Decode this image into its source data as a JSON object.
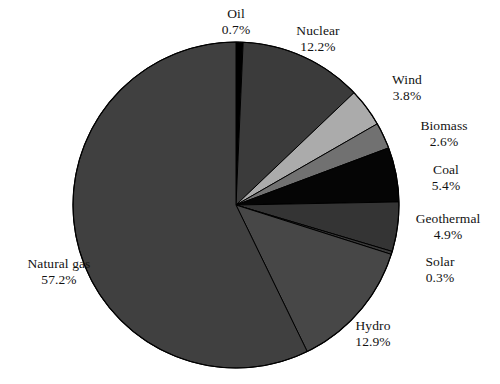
{
  "chart_data": {
    "type": "pie",
    "title": "",
    "subtitle": "",
    "xlabel": "",
    "ylabel": "",
    "legend_position": "labels-outside",
    "grid": false,
    "units": "percent",
    "start_angle_deg": 0,
    "direction": "clockwise",
    "categories": [
      "Oil",
      "Nuclear",
      "Wind",
      "Biomass",
      "Coal",
      "Geothermal",
      "Solar",
      "Hydro",
      "Natural gas"
    ],
    "values": [
      0.7,
      12.2,
      3.8,
      2.6,
      5.4,
      4.9,
      0.3,
      12.9,
      57.2
    ],
    "labels": [
      "0.7%",
      "12.2%",
      "3.8%",
      "2.6%",
      "5.4%",
      "4.9%",
      "0.3%",
      "12.9%",
      "57.2%"
    ],
    "slices": [
      {
        "name": "Oil",
        "value": 0.7,
        "label": "0.7%",
        "color": "#000000"
      },
      {
        "name": "Nuclear",
        "value": 12.2,
        "label": "12.2%",
        "color": "#3b3b3b"
      },
      {
        "name": "Wind",
        "value": 3.8,
        "label": "3.8%",
        "color": "#ababab"
      },
      {
        "name": "Biomass",
        "value": 2.6,
        "label": "2.6%",
        "color": "#717171"
      },
      {
        "name": "Coal",
        "value": 5.4,
        "label": "5.4%",
        "color": "#050505"
      },
      {
        "name": "Geothermal",
        "value": 4.9,
        "label": "4.9%",
        "color": "#343434"
      },
      {
        "name": "Solar",
        "value": 0.3,
        "label": "0.3%",
        "color": "#3a3a3a"
      },
      {
        "name": "Hydro",
        "value": 12.9,
        "label": "12.9%",
        "color": "#474747"
      },
      {
        "name": "Natural gas",
        "value": 57.2,
        "label": "57.2%",
        "color": "#404040"
      }
    ]
  },
  "labels": {
    "oil": {
      "name": "Oil",
      "pct": "0.7%"
    },
    "nuclear": {
      "name": "Nuclear",
      "pct": "12.2%"
    },
    "wind": {
      "name": "Wind",
      "pct": "3.8%"
    },
    "biomass": {
      "name": "Biomass",
      "pct": "2.6%"
    },
    "coal": {
      "name": "Coal",
      "pct": "5.4%"
    },
    "geothermal": {
      "name": "Geothermal",
      "pct": "4.9%"
    },
    "solar": {
      "name": "Solar",
      "pct": "0.3%"
    },
    "hydro": {
      "name": "Hydro",
      "pct": "12.9%"
    },
    "natural_gas": {
      "name": "Natural gas",
      "pct": "57.2%"
    }
  },
  "geometry": {
    "center_x": 236,
    "center_y": 205,
    "radius": 163
  },
  "colors": {
    "background": "#ffffff",
    "outline": "#000000",
    "text": "#121212"
  }
}
